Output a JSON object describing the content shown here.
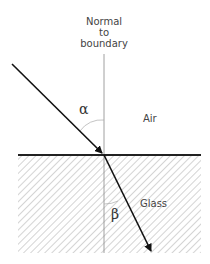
{
  "labels": {
    "normal": [
      "Normal",
      "to",
      "boundary"
    ],
    "air": "Air",
    "glass": "Glass",
    "incidence_angle": "α",
    "refraction_angle": "β"
  },
  "colors": {
    "ray": "#111111",
    "normal": "#888888",
    "hatch": "#aaaaaa",
    "boundary": "#222222"
  }
}
